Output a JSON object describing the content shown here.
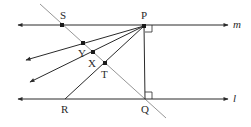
{
  "diagram": {
    "type": "geometry",
    "lines": {
      "m": {
        "label": "m",
        "y": 25,
        "x1": 18,
        "x2": 228
      },
      "l": {
        "label": "l",
        "y": 99,
        "x1": 18,
        "x2": 228
      }
    },
    "points": {
      "P": {
        "label": "P",
        "x": 144,
        "y": 25
      },
      "Q": {
        "label": "Q",
        "x": 145,
        "y": 99
      },
      "S": {
        "label": "S",
        "x": 62,
        "y": 25
      },
      "Y": {
        "label": "Y",
        "x": 83,
        "y": 43
      },
      "X": {
        "label": "X",
        "x": 93,
        "y": 52
      },
      "T": {
        "label": "T",
        "x": 105,
        "y": 63
      },
      "R": {
        "label": "R",
        "x": 65,
        "y": 99
      }
    },
    "segments": [
      {
        "name": "PQ",
        "note": "perpendicular to m and l"
      },
      {
        "name": "PR",
        "through": "T"
      },
      {
        "name": "ray PY",
        "through": "Y"
      },
      {
        "name": "ray PX",
        "through": "X"
      },
      {
        "name": "transversal SQ",
        "through": [
          "S",
          "Y",
          "X",
          "T",
          "Q"
        ]
      }
    ],
    "right_angles": [
      "P",
      "Q"
    ],
    "colors": {
      "ink": "#2a2a2a",
      "transversal": "#8a8a8a",
      "background": "#ffffff"
    }
  }
}
